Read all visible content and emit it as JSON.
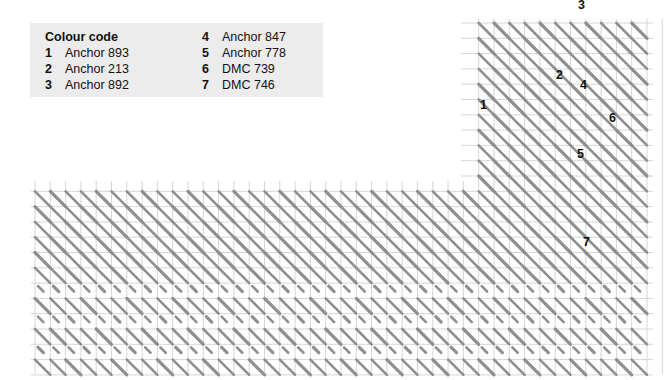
{
  "legend": {
    "title": "Colour code",
    "items": [
      {
        "num": "1",
        "name": "Anchor 893"
      },
      {
        "num": "2",
        "name": "Anchor 213"
      },
      {
        "num": "3",
        "name": "Anchor 892"
      },
      {
        "num": "4",
        "name": "Anchor 847"
      },
      {
        "num": "5",
        "name": "Anchor 778"
      },
      {
        "num": "6",
        "name": "DMC 739"
      },
      {
        "num": "7",
        "name": "DMC 746"
      }
    ]
  },
  "labels": [
    {
      "text": "1",
      "x": 480,
      "y": 98
    },
    {
      "text": "2",
      "x": 556,
      "y": 68
    },
    {
      "text": "3",
      "x": 578,
      "y": -2
    },
    {
      "text": "4",
      "x": 580,
      "y": 78
    },
    {
      "text": "5",
      "x": 577,
      "y": 147
    },
    {
      "text": "6",
      "x": 609,
      "y": 111
    },
    {
      "text": "7",
      "x": 583,
      "y": 235
    }
  ],
  "grid": {
    "left": 35,
    "top": 23,
    "right": 645,
    "bottom": 368,
    "pitch": 15.3,
    "corner_x": 465,
    "corner_y": 185,
    "grid_color": "#d6d6d6",
    "stitch_color": "#8f8f8f"
  }
}
